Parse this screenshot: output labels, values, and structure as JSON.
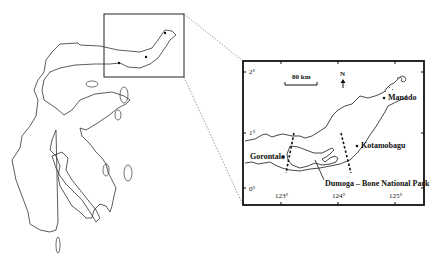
{
  "map": {
    "overview": {
      "region": "Sulawesi island outline",
      "inset_box": {
        "x": 104,
        "y": 14,
        "w": 80,
        "h": 63
      }
    },
    "inset": {
      "scale_bar": "80 km",
      "north_label": "N",
      "north_arrow": "up-arrow",
      "places": [
        {
          "name": "Manado",
          "type": "town"
        },
        {
          "name": "Kotamobagu",
          "type": "town"
        },
        {
          "name": "Gorontalo",
          "type": "town"
        },
        {
          "name": "Dumoga – Bone National Park",
          "type": "park"
        }
      ],
      "lat_ticks": [
        "2°",
        "1°",
        "0°"
      ],
      "lon_ticks": [
        "123°",
        "124°",
        "125°"
      ]
    }
  }
}
